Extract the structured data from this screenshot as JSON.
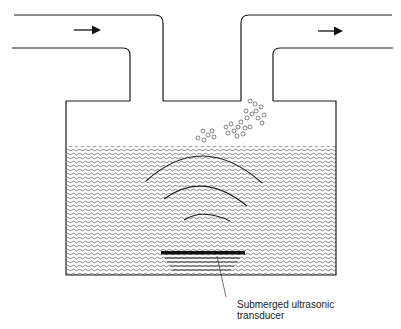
{
  "diagram": {
    "type": "ultrasonic nebulizer schematic",
    "label": {
      "line1": "Submerged ultrasonic",
      "line2": "transducer"
    },
    "arrows": [
      {
        "name": "inlet-flow-arrow",
        "direction": "right"
      },
      {
        "name": "outlet-flow-arrow",
        "direction": "right"
      }
    ],
    "colors": {
      "line": "#1a1a1a",
      "background": "#ffffff",
      "liquid_hatch": "#555555"
    }
  }
}
